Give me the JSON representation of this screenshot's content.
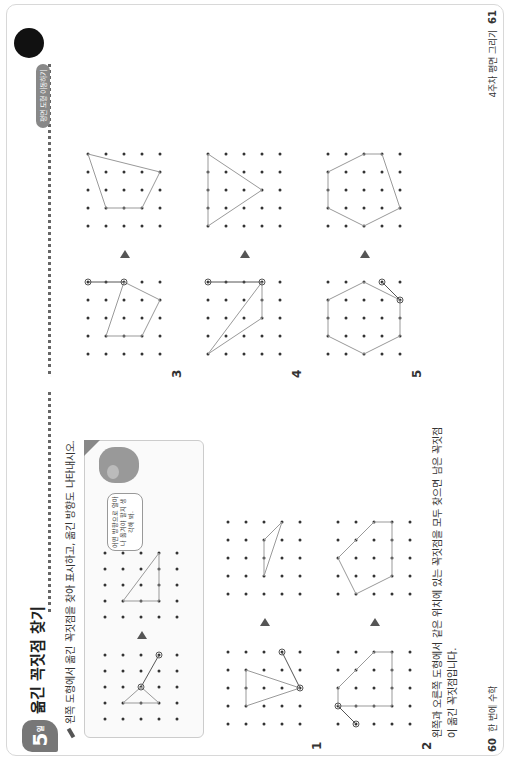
{
  "header": {
    "day_number": "5",
    "day_suffix": "일",
    "title": "옮긴 꼭짓점 찾기",
    "tag": "평면 도형 이동하기",
    "instruction": "왼쪽 도형에서 옮긴 꼭짓점을 찾아 표시하고, 옮긴 방향도 나타내시오."
  },
  "example": {
    "bubble_text": "어떤 방향으로 얼마나 옮겨야 할지 생각해 봐."
  },
  "problems": [
    {
      "number": "1"
    },
    {
      "number": "2"
    },
    {
      "number": "3"
    },
    {
      "number": "4"
    },
    {
      "number": "5"
    }
  ],
  "answer_text_line1": "왼쪽과 오른쪽 도형에서 같은 위치에 있는 꼭짓점을 모두 찾으면 남은 꼭짓점",
  "answer_text_line2": "이 옮긴 꼭짓점입니다.",
  "footer": {
    "left_page": "60",
    "left_label": "한 번에 수학",
    "right_page": "61",
    "right_label": "4주차 평면 그리기"
  },
  "colors": {
    "accent": "#777777",
    "line": "#bbbbbb",
    "dot": "#333333"
  }
}
